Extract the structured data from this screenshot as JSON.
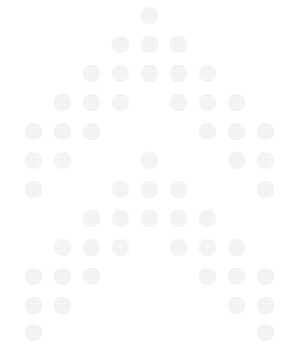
{
  "figure": {
    "width": 298,
    "height": 345,
    "background_color": "#ffffff",
    "dot_color": "#ececec",
    "dot_diameter": 17,
    "grid": {
      "columns": 9,
      "rows": 12,
      "column_centers_x": [
        33,
        62,
        91,
        120,
        149,
        178,
        207,
        236,
        265
      ],
      "row_centers_y": [
        15,
        44,
        73,
        102,
        131,
        160,
        189,
        218,
        247,
        276,
        305,
        332
      ],
      "column_spacing": 29,
      "row_spacing": 29
    },
    "dot_count": 52,
    "pattern_rows": [
      {
        "row": 1,
        "columns": [
          5
        ]
      },
      {
        "row": 2,
        "columns": [
          4,
          5,
          6
        ]
      },
      {
        "row": 3,
        "columns": [
          3,
          4,
          5,
          6,
          7
        ]
      },
      {
        "row": 4,
        "columns": [
          2,
          3,
          4,
          6,
          7,
          8
        ]
      },
      {
        "row": 5,
        "columns": [
          1,
          2,
          3,
          7,
          8,
          9
        ]
      },
      {
        "row": 6,
        "columns": [
          1,
          2,
          5,
          8,
          9
        ]
      },
      {
        "row": 7,
        "columns": [
          1,
          4,
          5,
          6,
          9
        ]
      },
      {
        "row": 8,
        "columns": [
          3,
          4,
          5,
          6,
          7
        ]
      },
      {
        "row": 9,
        "columns": [
          2,
          3,
          4,
          6,
          7,
          8
        ]
      },
      {
        "row": 10,
        "columns": [
          1,
          2,
          3,
          7,
          8,
          9
        ]
      },
      {
        "row": 11,
        "columns": [
          1,
          2,
          8,
          9
        ]
      },
      {
        "row": 12,
        "columns": [
          1,
          9
        ]
      }
    ]
  }
}
